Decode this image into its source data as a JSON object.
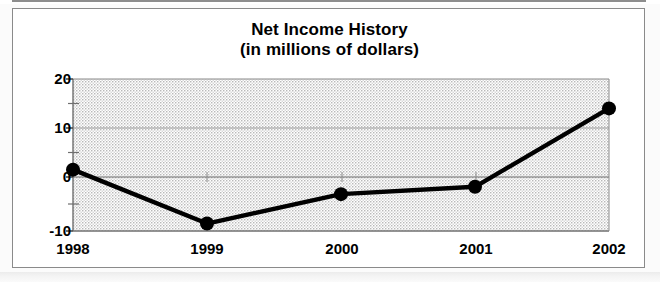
{
  "document": {
    "frame_label": "chart-frame"
  },
  "chart_data": {
    "type": "line",
    "title": "Net Income History",
    "subtitle": "(in millions of dollars)",
    "xlabel": "",
    "ylabel": "",
    "categories": [
      "1998",
      "1999",
      "2000",
      "2001",
      "2002"
    ],
    "values": [
      1.5,
      -9.5,
      -3.5,
      -2,
      14
    ],
    "series": [
      {
        "name": "Net Income",
        "values": [
          1.5,
          -9.5,
          -3.5,
          -2,
          14
        ]
      }
    ],
    "ylim": [
      -10,
      20
    ],
    "ytick_labels": [
      "20",
      "10",
      "0",
      "-10"
    ],
    "ytick_values": [
      20,
      10,
      0,
      -10
    ],
    "yminor_tick_values": [
      15,
      5,
      -5
    ],
    "xtick_labels": [
      "1998",
      "1999",
      "2000",
      "2001",
      "2002"
    ],
    "grid": true,
    "legend": "none",
    "colors": {
      "line": "#000000",
      "marker": "#000000",
      "plot_background": "#d9d9d9",
      "gridline": "#8a8a8a",
      "frame": "#8a8a8a",
      "text": "#000000",
      "page": "#ffffff"
    },
    "marker_style": "filled-circle",
    "line_width_px": 4,
    "marker_radius_px": 7
  }
}
